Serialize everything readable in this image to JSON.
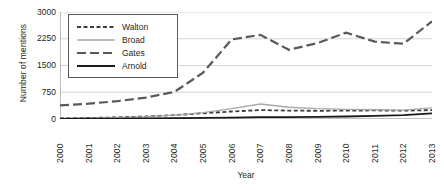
{
  "chart_data": {
    "type": "line",
    "title": "",
    "xlabel": "Year",
    "ylabel": "Number of mentions",
    "categories": [
      "2000",
      "2001",
      "2002",
      "2003",
      "2004",
      "2005",
      "2006",
      "2007",
      "2008",
      "2009",
      "2010",
      "2011",
      "2012",
      "2013"
    ],
    "x": [
      2000,
      2001,
      2002,
      2003,
      2004,
      2005,
      2006,
      2007,
      2008,
      2009,
      2010,
      2011,
      2012,
      2013
    ],
    "ylim": [
      0,
      3000
    ],
    "yticks": [
      0,
      750,
      1500,
      2250,
      3000
    ],
    "ytick_labels": [
      "0",
      "750",
      "1500",
      "2250",
      "3000"
    ],
    "grid": true,
    "grid_axis": "y",
    "legend_position": "upper-left-inside",
    "series": [
      {
        "name": "Walton",
        "style": "short-dashed",
        "color": "#3c3c3c",
        "values": [
          20,
          30,
          45,
          70,
          110,
          160,
          210,
          250,
          235,
          230,
          235,
          240,
          235,
          250
        ]
      },
      {
        "name": "Broad",
        "style": "solid-light",
        "color": "#a8a8a8",
        "values": [
          15,
          25,
          40,
          65,
          110,
          180,
          290,
          420,
          330,
          290,
          270,
          260,
          250,
          310
        ]
      },
      {
        "name": "Gates",
        "style": "long-dashed",
        "color": "#595959",
        "values": [
          380,
          430,
          500,
          600,
          760,
          1300,
          2230,
          2360,
          1940,
          2130,
          2420,
          2170,
          2110,
          2740
        ]
      },
      {
        "name": "Arnold",
        "style": "solid-dark",
        "color": "#1a1a1a",
        "values": [
          5,
          8,
          10,
          15,
          22,
          30,
          40,
          50,
          55,
          60,
          70,
          85,
          110,
          160
        ]
      }
    ]
  },
  "legend": {
    "items": [
      {
        "label": "Walton",
        "swatch": "short-dashed-line-icon"
      },
      {
        "label": "Broad",
        "swatch": "light-solid-line-icon"
      },
      {
        "label": "Gates",
        "swatch": "long-dashed-line-icon"
      },
      {
        "label": "Arnold",
        "swatch": "dark-solid-line-icon"
      }
    ]
  },
  "colors": {
    "walton": "#3c3c3c",
    "broad": "#a8a8a8",
    "gates": "#595959",
    "arnold": "#1a1a1a",
    "grid": "#c9c9c9",
    "axis": "#808080",
    "text": "#231f20"
  }
}
